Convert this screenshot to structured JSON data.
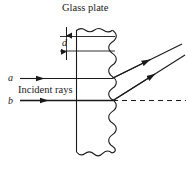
{
  "figure": {
    "title": "Glass plate",
    "thickness_label": "d",
    "incident_label": "Incident rays",
    "ray_a_label": "a",
    "ray_b_label": "b",
    "stroke_color": "#1a1a1a",
    "background_color": "#ffffff",
    "elements": {
      "glass_plate": "glass-plate",
      "top_edge": "wavy-top-edge",
      "bottom_edge": "wavy-bottom-edge",
      "left_edge": "straight-left-edge",
      "right_edge": "wavy-right-edge",
      "thickness_arrow_up": "thickness-arrow-up",
      "thickness_arrow_down": "thickness-arrow-down",
      "incident_ray_a": "incident-ray-a",
      "incident_ray_b": "incident-ray-b",
      "reflected_ray_a": "reflected-ray-a",
      "reflected_ray_b": "reflected-ray-b",
      "normal_dashed_line": "dashed-reference-line"
    }
  }
}
